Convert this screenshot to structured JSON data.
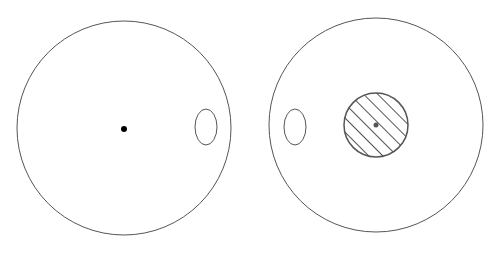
{
  "diagram": {
    "background": "#ffffff",
    "stroke_color": "#555555",
    "panels": [
      {
        "name": "left",
        "outer_circle": {
          "cx": 124,
          "cy": 128,
          "r": 107
        },
        "center_dot": {
          "cx": 124,
          "cy": 129,
          "r": 3,
          "color": "#000000"
        },
        "side_ellipse": {
          "cx": 206,
          "cy": 127,
          "rx": 11,
          "ry": 18
        }
      },
      {
        "name": "right",
        "outer_circle": {
          "cx": 376,
          "cy": 125,
          "r": 107
        },
        "side_ellipse": {
          "cx": 295,
          "cy": 127,
          "rx": 11,
          "ry": 18
        },
        "hatched_disc": {
          "cx": 376,
          "cy": 125,
          "r": 32,
          "hatch_color": "#555555"
        },
        "center_dot": {
          "cx": 376,
          "cy": 125,
          "r": 2.5,
          "color": "#555555"
        }
      }
    ]
  }
}
